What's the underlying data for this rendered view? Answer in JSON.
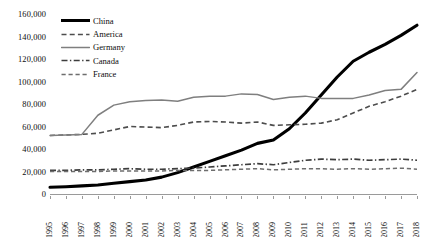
{
  "chart_data": {
    "type": "line",
    "title": "",
    "xlabel": "",
    "ylabel": "",
    "grid": false,
    "legend_position": "top-left",
    "ylim": [
      0,
      160000
    ],
    "y_ticks": [
      0,
      20000,
      40000,
      60000,
      80000,
      100000,
      120000,
      140000,
      160000
    ],
    "y_tick_labels": [
      "0",
      "20,000",
      "40,000",
      "60,000",
      "80,000",
      "100,000",
      "120,000",
      "140,000",
      "160,000"
    ],
    "categories": [
      "1995",
      "1996",
      "1997",
      "1998",
      "1999",
      "2000",
      "2001",
      "2002",
      "2003",
      "2004",
      "2005",
      "2006",
      "2007",
      "2008",
      "2009",
      "2010",
      "2011",
      "2012",
      "2013",
      "2014",
      "2015",
      "2016",
      "2017",
      "2018"
    ],
    "series": [
      {
        "name": "China",
        "style": "solid-thick",
        "color": "#000000",
        "values": [
          6000,
          6500,
          7200,
          8000,
          9500,
          11000,
          12500,
          15000,
          19000,
          24000,
          29000,
          34000,
          39000,
          45000,
          48000,
          58000,
          72000,
          88000,
          104000,
          118000,
          126000,
          133000,
          141000,
          150000
        ]
      },
      {
        "name": "America",
        "style": "dashed",
        "color": "#4d4d4d",
        "values": [
          52000,
          52500,
          53000,
          54000,
          57000,
          60000,
          59500,
          59000,
          61000,
          64000,
          64500,
          64000,
          63000,
          64000,
          61000,
          61500,
          62000,
          63000,
          66000,
          72000,
          78000,
          82000,
          87000,
          93000
        ]
      },
      {
        "name": "Germany",
        "style": "solid",
        "color": "#7f7f7f",
        "values": [
          52000,
          52500,
          53000,
          70000,
          79000,
          82000,
          83000,
          83500,
          82500,
          86000,
          87000,
          87000,
          89000,
          88500,
          84000,
          86000,
          87000,
          85000,
          85000,
          85000,
          88000,
          92000,
          93000,
          108000
        ]
      },
      {
        "name": "Canada",
        "style": "dash-dot",
        "color": "#3d3d3d",
        "values": [
          21000,
          21000,
          21500,
          21500,
          22000,
          22500,
          22000,
          22000,
          22500,
          23000,
          24000,
          25000,
          26000,
          27000,
          26000,
          28000,
          30000,
          31000,
          30500,
          31000,
          30000,
          30500,
          31000,
          30000
        ]
      },
      {
        "name": "France",
        "style": "dashed-gray",
        "color": "#6e6e6e",
        "values": [
          20000,
          20000,
          20000,
          20000,
          20500,
          20500,
          20500,
          20500,
          21000,
          21000,
          21000,
          21500,
          22000,
          22500,
          21500,
          22000,
          22500,
          22500,
          22000,
          22500,
          22000,
          22500,
          23000,
          22000
        ]
      }
    ]
  },
  "legend": {
    "items": [
      {
        "label": "China"
      },
      {
        "label": "America"
      },
      {
        "label": "Germany"
      },
      {
        "label": "Canada"
      },
      {
        "label": "France"
      }
    ]
  }
}
